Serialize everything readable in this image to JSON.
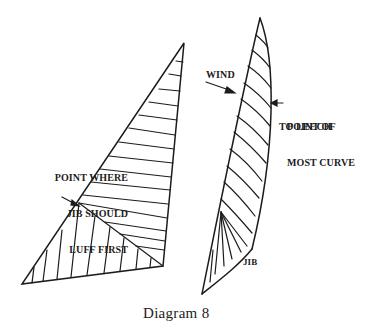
{
  "figure": {
    "caption": "Diagram 8",
    "ink_color": "#1c1c1c",
    "background": "#ffffff"
  },
  "mainsail": {
    "label_lines": [
      "POINT WHERE",
      "JIB SHOULD",
      "LUFF FIRST"
    ],
    "vertices": {
      "head": [
        184,
        43
      ],
      "clew": [
        163,
        266
      ],
      "tack": [
        22,
        284
      ]
    },
    "luff_point": [
      79,
      218
    ]
  },
  "jib": {
    "name_label": "JIB",
    "wind_label": "WIND",
    "leech_label_lines": [
      "POINT OF",
      "MOST CURVE",
      "TO LEECH"
    ],
    "vertices": {
      "head": [
        260,
        18
      ],
      "clew": [
        252,
        249
      ],
      "tack": [
        202,
        294
      ]
    }
  }
}
